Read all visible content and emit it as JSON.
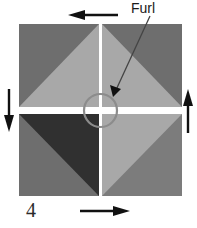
{
  "figure": {
    "step_number": "4",
    "callout_label": "Furl",
    "width": 197,
    "height": 228,
    "background_color": "#ffffff"
  },
  "colors": {
    "dark_gray": "#6e6e6e",
    "light_gray": "#a8a8a8",
    "near_black": "#303030",
    "mid_gray": "#7c7c7c",
    "gap_white": "#ffffff",
    "circle_stroke": "#8c8c8c",
    "arrow_black": "#111111",
    "leader_line": "#444444",
    "text_color": "#1a1a1a"
  },
  "square": {
    "left": 19,
    "top": 24,
    "right": 182,
    "bottom": 196,
    "center_x": 100.5,
    "center_y": 110.5,
    "gap_vertical_width": 3,
    "gap_horizontal_height": 7
  },
  "quadrants": [
    {
      "name": "top-left",
      "base_fill": "#6e6e6e",
      "triangle_fill": "#a8a8a8",
      "triangle_corner": "bottom-right",
      "description": "dark gray square with light gray triangle on the lower-right half"
    },
    {
      "name": "top-right",
      "base_fill": "#6e6e6e",
      "triangle_fill": "#a8a8a8",
      "triangle_corner": "bottom-left",
      "description": "dark gray square with light gray triangle on the lower-left half"
    },
    {
      "name": "bottom-left",
      "base_fill": "#6e6e6e",
      "triangle_fill": "#303030",
      "triangle_corner": "top-right",
      "description": "gray square with near-black triangle on the upper-right half"
    },
    {
      "name": "bottom-right",
      "base_fill": "#7c7c7c",
      "triangle_fill": "#a8a8a8",
      "triangle_corner": "top-left",
      "description": "gray square with light gray triangle on the upper-left half"
    }
  ],
  "center_circle": {
    "cx": 100.5,
    "cy": 110.5,
    "r": 16.5,
    "stroke": "#8c8c8c",
    "stroke_width": 2.2
  },
  "callout": {
    "text": "Furl",
    "line_from_x": 150,
    "line_from_y": 16,
    "line_to_x": 113,
    "line_to_y": 96,
    "arrowhead": "filled-triangle"
  },
  "rotation_arrows": [
    {
      "name": "top-arrow",
      "direction": "left",
      "x1": 118,
      "y1": 15,
      "x2": 70,
      "y2": 15,
      "description": "horizontal arrow above the square pointing left"
    },
    {
      "name": "right-arrow",
      "direction": "up",
      "x1": 188,
      "y1": 133,
      "x2": 188,
      "y2": 91,
      "description": "vertical arrow right of the square pointing up"
    },
    {
      "name": "bottom-arrow",
      "direction": "right",
      "x1": 80,
      "y1": 211,
      "x2": 128,
      "y2": 211,
      "description": "horizontal arrow below the square pointing right"
    },
    {
      "name": "left-arrow",
      "direction": "down",
      "x1": 9,
      "y1": 89,
      "x2": 9,
      "y2": 130,
      "description": "vertical arrow left of the square pointing down"
    }
  ]
}
